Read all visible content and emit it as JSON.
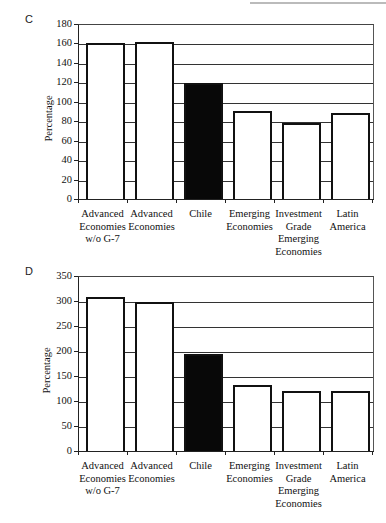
{
  "chart_data": [
    {
      "panel": "C",
      "type": "bar",
      "title": "",
      "xlabel": "",
      "ylabel": "Percentage",
      "ylim": [
        0,
        180
      ],
      "yticks": [
        0,
        20,
        40,
        60,
        80,
        100,
        120,
        140,
        160,
        180
      ],
      "grid": true,
      "legend": "none",
      "categories": [
        "Advanced Economies w/o G-7",
        "Advanced Economies",
        "Chile",
        "Emerging Economies",
        "Investment Grade Emerging Economies",
        "Latin America"
      ],
      "category_lines": [
        [
          "Advanced",
          "Economies",
          "w/o G-7"
        ],
        [
          "Advanced",
          "Economies"
        ],
        [
          "Chile"
        ],
        [
          "Emerging",
          "Economies"
        ],
        [
          "Investment",
          "Grade",
          "Emerging",
          "Economies"
        ],
        [
          "Latin",
          "America"
        ]
      ],
      "values": [
        161,
        163,
        120,
        92,
        79,
        89
      ],
      "highlight": "Chile",
      "colors": {
        "default": "#ffffff",
        "highlight": "#080808",
        "edge": "#111111"
      }
    },
    {
      "panel": "D",
      "type": "bar",
      "title": "",
      "xlabel": "",
      "ylabel": "Percentage",
      "ylim": [
        0,
        350
      ],
      "yticks": [
        0,
        50,
        100,
        150,
        200,
        250,
        300,
        350
      ],
      "grid": true,
      "legend": "none",
      "categories": [
        "Advanced Economies w/o G-7",
        "Advanced Economies",
        "Chile",
        "Emerging Economies",
        "Investment Grade Emerging Economies",
        "Latin America"
      ],
      "category_lines": [
        [
          "Advanced",
          "Economies",
          "w/o G-7"
        ],
        [
          "Advanced",
          "Economies"
        ],
        [
          "Chile"
        ],
        [
          "Emerging",
          "Economies"
        ],
        [
          "Investment",
          "Grade",
          "Emerging",
          "Economies"
        ],
        [
          "Latin",
          "America"
        ]
      ],
      "values": [
        311,
        300,
        196,
        135,
        123,
        122
      ],
      "highlight": "Chile",
      "colors": {
        "default": "#ffffff",
        "highlight": "#080808",
        "edge": "#111111"
      }
    }
  ]
}
